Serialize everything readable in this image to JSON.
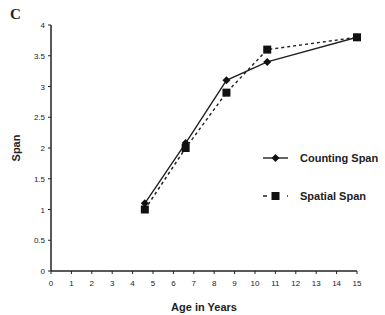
{
  "panel_label": "C",
  "chart_data": {
    "type": "line",
    "title": "",
    "xlabel": "Age in Years",
    "ylabel": "Span",
    "xlim": [
      0,
      15
    ],
    "ylim": [
      0,
      4
    ],
    "xticks": [
      0,
      1,
      2,
      3,
      4,
      5,
      6,
      7,
      8,
      9,
      10,
      11,
      12,
      13,
      14,
      15
    ],
    "yticks": [
      0,
      0.5,
      1,
      1.5,
      2,
      2.5,
      3,
      3.5,
      4
    ],
    "ytick_labels": [
      "0",
      "0.5",
      "1",
      "1.5",
      "2",
      "2.5",
      "3",
      "3.5",
      "4"
    ],
    "grid": false,
    "legend_position": "right-middle",
    "series": [
      {
        "name": "Counting Span",
        "style": "solid",
        "marker": "diamond",
        "x": [
          4.6,
          6.6,
          8.6,
          10.6,
          15
        ],
        "values": [
          1.1,
          2.08,
          3.1,
          3.4,
          3.8
        ]
      },
      {
        "name": "Spatial Span",
        "style": "dashed",
        "marker": "square",
        "x": [
          4.6,
          6.6,
          8.6,
          10.6,
          15
        ],
        "values": [
          1.0,
          2.0,
          2.9,
          3.6,
          3.8
        ]
      }
    ]
  }
}
